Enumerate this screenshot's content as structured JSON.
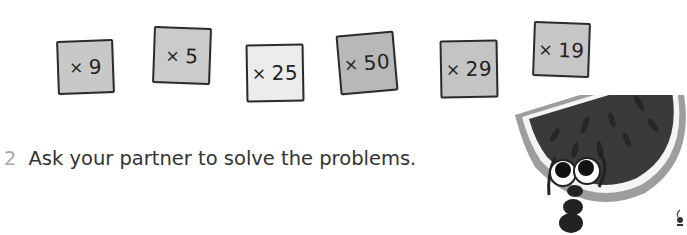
{
  "cards": [
    {
      "operator": "×",
      "value": "9",
      "fill": "#c8c8c8"
    },
    {
      "operator": "×",
      "value": "5",
      "fill": "#cbcbcb"
    },
    {
      "operator": "×",
      "value": "25",
      "fill": "#ececec"
    },
    {
      "operator": "×",
      "value": "50",
      "fill": "#b8b8b8"
    },
    {
      "operator": "×",
      "value": "29",
      "fill": "#c4c4c4"
    },
    {
      "operator": "×",
      "value": "19",
      "fill": "#c6c6c6"
    }
  ],
  "instruction": {
    "number": "2",
    "text": "Ask your partner to solve the problems."
  },
  "illustration": {
    "subject": "watermelon-slice-ant-mascot"
  }
}
